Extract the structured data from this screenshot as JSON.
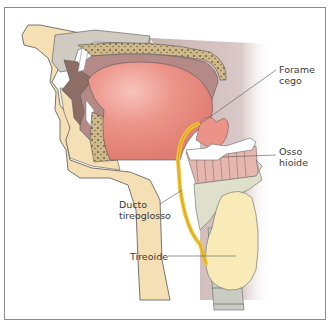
{
  "figure": {
    "labels": [
      {
        "id": "forame-cego",
        "text": "Forame\ncego",
        "x": 279,
        "y": 64
      },
      {
        "id": "osso-hioide",
        "text": "Osso\nhioide",
        "x": 279,
        "y": 146
      },
      {
        "id": "ducto-tireoglosso",
        "text": "Ducto\ntireoglosso",
        "x": 119,
        "y": 199
      },
      {
        "id": "tireoide",
        "text": "Tireoide",
        "x": 130,
        "y": 251
      }
    ],
    "colors": {
      "skin": "#f5dfb4",
      "tongue": "#e98a80",
      "oral_cavity": "#b58a86",
      "bone_grey": "#cfcbc2",
      "duct": "#f2c230",
      "thyroid": "#f8ebb8",
      "cartilage": "#dfe0cc",
      "palate": "#cdb98c",
      "line": "#555555"
    }
  }
}
